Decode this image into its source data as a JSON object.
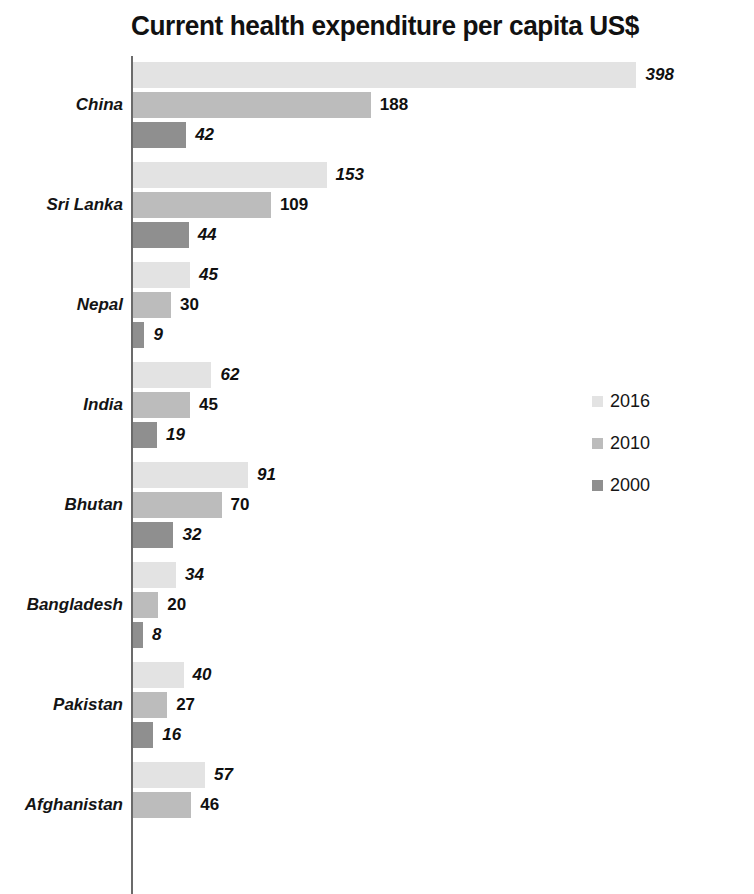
{
  "chart_data": {
    "type": "bar",
    "orientation": "horizontal",
    "title": "Current health expenditure per capita US$",
    "xlabel": "",
    "ylabel": "",
    "categories": [
      "China",
      "Sri Lanka",
      "Nepal",
      "India",
      "Bhutan",
      "Bangladesh",
      "Pakistan",
      "Afghanistan"
    ],
    "series": [
      {
        "name": "2016",
        "color": "#e3e3e3",
        "values": [
          398,
          153,
          45,
          62,
          91,
          34,
          40,
          57
        ]
      },
      {
        "name": "2010",
        "color": "#bcbcbc",
        "values": [
          188,
          109,
          30,
          45,
          70,
          20,
          27,
          46
        ]
      },
      {
        "name": "2000",
        "color": "#8f8f8f",
        "values": [
          42,
          44,
          9,
          19,
          32,
          8,
          16,
          null
        ]
      }
    ],
    "legend": {
      "position": "right",
      "entries": [
        "2016",
        "2010",
        "2000"
      ]
    },
    "grid": false,
    "xlim": [
      0,
      398
    ],
    "value_labels": true,
    "axis_color": "#6b6b6b"
  },
  "legend": {
    "items": [
      {
        "label": "2016",
        "swatch": "legend-swatch-2016"
      },
      {
        "label": "2010",
        "swatch": "legend-swatch-2010"
      },
      {
        "label": "2000",
        "swatch": "legend-swatch-2000"
      }
    ]
  },
  "groups": [
    {
      "label": "China",
      "bars": [
        {
          "series": "2016",
          "value": 398,
          "value_text": "398",
          "italic": true
        },
        {
          "series": "2010",
          "value": 188,
          "value_text": "188",
          "italic": false
        },
        {
          "series": "2000",
          "value": 42,
          "value_text": "42",
          "italic": true
        }
      ]
    },
    {
      "label": "Sri Lanka",
      "bars": [
        {
          "series": "2016",
          "value": 153,
          "value_text": "153",
          "italic": true
        },
        {
          "series": "2010",
          "value": 109,
          "value_text": "109",
          "italic": false
        },
        {
          "series": "2000",
          "value": 44,
          "value_text": "44",
          "italic": true
        }
      ]
    },
    {
      "label": "Nepal",
      "bars": [
        {
          "series": "2016",
          "value": 45,
          "value_text": "45",
          "italic": true
        },
        {
          "series": "2010",
          "value": 30,
          "value_text": "30",
          "italic": false
        },
        {
          "series": "2000",
          "value": 9,
          "value_text": "9",
          "italic": true
        }
      ]
    },
    {
      "label": "India",
      "bars": [
        {
          "series": "2016",
          "value": 62,
          "value_text": "62",
          "italic": true
        },
        {
          "series": "2010",
          "value": 45,
          "value_text": "45",
          "italic": false
        },
        {
          "series": "2000",
          "value": 19,
          "value_text": "19",
          "italic": true
        }
      ]
    },
    {
      "label": "Bhutan",
      "bars": [
        {
          "series": "2016",
          "value": 91,
          "value_text": "91",
          "italic": true
        },
        {
          "series": "2010",
          "value": 70,
          "value_text": "70",
          "italic": false
        },
        {
          "series": "2000",
          "value": 32,
          "value_text": "32",
          "italic": true
        }
      ]
    },
    {
      "label": "Bangladesh",
      "bars": [
        {
          "series": "2016",
          "value": 34,
          "value_text": "34",
          "italic": true
        },
        {
          "series": "2010",
          "value": 20,
          "value_text": "20",
          "italic": false
        },
        {
          "series": "2000",
          "value": 8,
          "value_text": "8",
          "italic": true
        }
      ]
    },
    {
      "label": "Pakistan",
      "bars": [
        {
          "series": "2016",
          "value": 40,
          "value_text": "40",
          "italic": true
        },
        {
          "series": "2010",
          "value": 27,
          "value_text": "27",
          "italic": false
        },
        {
          "series": "2000",
          "value": 16,
          "value_text": "16",
          "italic": true
        }
      ]
    },
    {
      "label": "Afghanistan",
      "bars": [
        {
          "series": "2016",
          "value": 57,
          "value_text": "57",
          "italic": true
        },
        {
          "series": "2010",
          "value": 46,
          "value_text": "46",
          "italic": false
        }
      ]
    }
  ],
  "layout": {
    "px_per_unit": 1.265,
    "axis_x": 133,
    "bar_height": 26,
    "bar_gap": 4,
    "group_pitch": 100,
    "first_bar_top": 10,
    "min_bar_width": 7,
    "value_label_offset": 9
  }
}
